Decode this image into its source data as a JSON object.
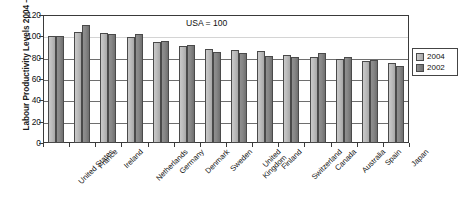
{
  "chart_data": {
    "type": "bar",
    "title": "",
    "xlabel": "",
    "ylabel": "Labour Productivity Levels 2004 – US=100",
    "ylim": [
      0,
      120
    ],
    "yticks": [
      0,
      20,
      40,
      60,
      80,
      100,
      120
    ],
    "grid": true,
    "legend_position": "right",
    "annotation": "USA = 100",
    "categories": [
      "United States",
      "France",
      "Ireland",
      "Netherlands",
      "Germany",
      "Denmark",
      "Sweden",
      "United Kingdom",
      "Finland",
      "Switzerland",
      "Canada",
      "Australia",
      "Spain",
      "Japan"
    ],
    "series": [
      {
        "name": "2004",
        "color": "#bdbdbd",
        "values": [
          100,
          104,
          103,
          99.5,
          94.5,
          91,
          88.5,
          87.5,
          86,
          82.5,
          81,
          79,
          77,
          75
        ]
      },
      {
        "name": "2002",
        "color": "#7d7d7d",
        "values": [
          100,
          110.5,
          102,
          102,
          96,
          91.5,
          85,
          84,
          81.5,
          81,
          84,
          81,
          78,
          72.5
        ]
      }
    ]
  },
  "legend": {
    "items": [
      {
        "label": "2004"
      },
      {
        "label": "2002"
      }
    ]
  }
}
